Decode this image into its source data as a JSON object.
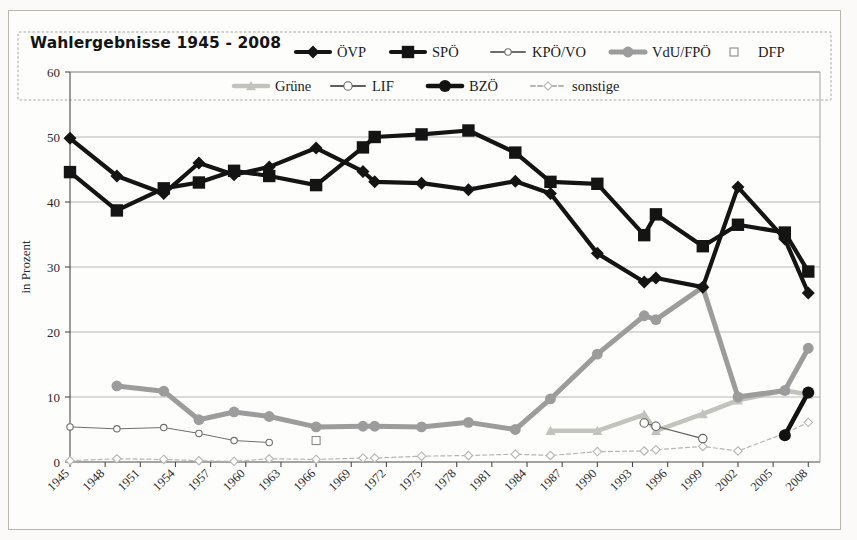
{
  "figure": {
    "title": "Wahlergebnisse 1945 - 2008",
    "background_color": "#fdfdfb",
    "border_color": "#b9b6ae"
  },
  "chart_data": {
    "type": "line",
    "title": "Wahlergebnisse 1945 - 2008",
    "xlabel": "",
    "ylabel": "in Prozent",
    "ylim": [
      0,
      60
    ],
    "ytick_step": 10,
    "yticks": [
      0,
      10,
      20,
      30,
      40,
      50,
      60
    ],
    "xlim": [
      1945,
      2009
    ],
    "xticks": [
      1945,
      1948,
      1951,
      1954,
      1957,
      1960,
      1963,
      1966,
      1969,
      1972,
      1975,
      1978,
      1981,
      1984,
      1987,
      1990,
      1993,
      1996,
      1999,
      2002,
      2005,
      2008
    ],
    "xtick_labels": [
      "1945",
      "1948",
      "1951",
      "1954",
      "1957",
      "1960",
      "1963",
      "1966",
      "1969",
      "1972",
      "1975",
      "1978",
      "1981",
      "1984",
      "1987",
      "1990",
      "1993",
      "1996",
      "1999",
      "2002",
      "2005",
      "2008"
    ],
    "grid": true,
    "grid_axis": "y",
    "legend_position": "top",
    "series": [
      {
        "name": "ÖVP",
        "marker": "diamond",
        "color": "#141414",
        "line_width": 4.2,
        "marker_size": 6.5,
        "dash": "none",
        "points": [
          {
            "x": 1945,
            "y": 49.8
          },
          {
            "x": 1949,
            "y": 44.0
          },
          {
            "x": 1953,
            "y": 41.3
          },
          {
            "x": 1956,
            "y": 46.0
          },
          {
            "x": 1959,
            "y": 44.2
          },
          {
            "x": 1962,
            "y": 45.4
          },
          {
            "x": 1966,
            "y": 48.3
          },
          {
            "x": 1970,
            "y": 44.7
          },
          {
            "x": 1971,
            "y": 43.1
          },
          {
            "x": 1975,
            "y": 42.9
          },
          {
            "x": 1979,
            "y": 41.9
          },
          {
            "x": 1983,
            "y": 43.2
          },
          {
            "x": 1986,
            "y": 41.3
          },
          {
            "x": 1990,
            "y": 32.1
          },
          {
            "x": 1994,
            "y": 27.7
          },
          {
            "x": 1995,
            "y": 28.3
          },
          {
            "x": 1999,
            "y": 26.9
          },
          {
            "x": 2002,
            "y": 42.3
          },
          {
            "x": 2006,
            "y": 34.3
          },
          {
            "x": 2008,
            "y": 26.0
          }
        ]
      },
      {
        "name": "SPÖ",
        "marker": "square",
        "color": "#141414",
        "line_width": 4.2,
        "marker_size": 6.2,
        "dash": "none",
        "points": [
          {
            "x": 1945,
            "y": 44.6
          },
          {
            "x": 1949,
            "y": 38.7
          },
          {
            "x": 1953,
            "y": 42.1
          },
          {
            "x": 1956,
            "y": 43.0
          },
          {
            "x": 1959,
            "y": 44.8
          },
          {
            "x": 1962,
            "y": 44.0
          },
          {
            "x": 1966,
            "y": 42.6
          },
          {
            "x": 1970,
            "y": 48.4
          },
          {
            "x": 1971,
            "y": 50.0
          },
          {
            "x": 1975,
            "y": 50.4
          },
          {
            "x": 1979,
            "y": 51.0
          },
          {
            "x": 1983,
            "y": 47.6
          },
          {
            "x": 1986,
            "y": 43.1
          },
          {
            "x": 1990,
            "y": 42.8
          },
          {
            "x": 1994,
            "y": 34.9
          },
          {
            "x": 1995,
            "y": 38.1
          },
          {
            "x": 1999,
            "y": 33.2
          },
          {
            "x": 2002,
            "y": 36.5
          },
          {
            "x": 2006,
            "y": 35.3
          },
          {
            "x": 2008,
            "y": 29.3
          }
        ]
      },
      {
        "name": "KPÖ/VO",
        "marker": "circle-open",
        "color": "#6e6e6e",
        "line_width": 1.0,
        "marker_size": 3.2,
        "dash": "none",
        "points": [
          {
            "x": 1945,
            "y": 5.4
          },
          {
            "x": 1949,
            "y": 5.1
          },
          {
            "x": 1953,
            "y": 5.3
          },
          {
            "x": 1956,
            "y": 4.4
          },
          {
            "x": 1959,
            "y": 3.3
          },
          {
            "x": 1962,
            "y": 3.0
          }
        ]
      },
      {
        "name": "VdU/FPÖ",
        "marker": "circle",
        "color": "#9c9c9c",
        "line_width": 5.0,
        "marker_size": 5.4,
        "dash": "none",
        "points": [
          {
            "x": 1949,
            "y": 11.7
          },
          {
            "x": 1953,
            "y": 10.9
          },
          {
            "x": 1956,
            "y": 6.5
          },
          {
            "x": 1959,
            "y": 7.7
          },
          {
            "x": 1962,
            "y": 7.0
          },
          {
            "x": 1966,
            "y": 5.4
          },
          {
            "x": 1970,
            "y": 5.5
          },
          {
            "x": 1971,
            "y": 5.5
          },
          {
            "x": 1975,
            "y": 5.4
          },
          {
            "x": 1979,
            "y": 6.1
          },
          {
            "x": 1983,
            "y": 5.0
          },
          {
            "x": 1986,
            "y": 9.7
          },
          {
            "x": 1990,
            "y": 16.6
          },
          {
            "x": 1994,
            "y": 22.5
          },
          {
            "x": 1995,
            "y": 21.9
          },
          {
            "x": 1999,
            "y": 26.9
          },
          {
            "x": 2002,
            "y": 10.0
          },
          {
            "x": 2006,
            "y": 11.0
          },
          {
            "x": 2008,
            "y": 17.5
          }
        ]
      },
      {
        "name": "DFP",
        "marker": "square-open",
        "color": "#8a8a8a",
        "line_width": 0,
        "marker_size": 4.0,
        "dash": "none",
        "points": [
          {
            "x": 1966,
            "y": 3.3
          }
        ]
      },
      {
        "name": "Grüne",
        "marker": "triangle",
        "color": "#c3c3bd",
        "line_width": 4.6,
        "marker_size": 5.0,
        "dash": "none",
        "points": [
          {
            "x": 1986,
            "y": 4.8
          },
          {
            "x": 1990,
            "y": 4.8
          },
          {
            "x": 1994,
            "y": 7.3
          },
          {
            "x": 1995,
            "y": 4.8
          },
          {
            "x": 1999,
            "y": 7.4
          },
          {
            "x": 2002,
            "y": 9.5
          },
          {
            "x": 2006,
            "y": 11.0
          },
          {
            "x": 2008,
            "y": 10.4
          }
        ]
      },
      {
        "name": "LIF",
        "marker": "circle-open",
        "color": "#5e5e5e",
        "line_width": 1.2,
        "marker_size": 4.2,
        "dash": "none",
        "points": [
          {
            "x": 1994,
            "y": 6.0
          },
          {
            "x": 1995,
            "y": 5.5
          },
          {
            "x": 1999,
            "y": 3.6
          }
        ]
      },
      {
        "name": "BZÖ",
        "marker": "circle-filled",
        "color": "#121212",
        "line_width": 4.6,
        "marker_size": 6.0,
        "dash": "none",
        "points": [
          {
            "x": 2006,
            "y": 4.1
          },
          {
            "x": 2008,
            "y": 10.7
          }
        ]
      },
      {
        "name": "sonstige",
        "marker": "diamond-open",
        "color": "#b6b6b0",
        "line_width": 1.2,
        "marker_size": 4.2,
        "dash": "4 3",
        "points": [
          {
            "x": 1945,
            "y": 0.2
          },
          {
            "x": 1949,
            "y": 0.5
          },
          {
            "x": 1953,
            "y": 0.4
          },
          {
            "x": 1956,
            "y": 0.2
          },
          {
            "x": 1959,
            "y": 0.1
          },
          {
            "x": 1962,
            "y": 0.5
          },
          {
            "x": 1966,
            "y": 0.4
          },
          {
            "x": 1970,
            "y": 0.6
          },
          {
            "x": 1971,
            "y": 0.6
          },
          {
            "x": 1975,
            "y": 0.9
          },
          {
            "x": 1979,
            "y": 1.0
          },
          {
            "x": 1983,
            "y": 1.2
          },
          {
            "x": 1986,
            "y": 1.0
          },
          {
            "x": 1990,
            "y": 1.6
          },
          {
            "x": 1994,
            "y": 1.7
          },
          {
            "x": 1995,
            "y": 1.9
          },
          {
            "x": 1999,
            "y": 2.4
          },
          {
            "x": 2002,
            "y": 1.7
          },
          {
            "x": 2006,
            "y": 4.4
          },
          {
            "x": 2008,
            "y": 6.1
          }
        ]
      }
    ]
  },
  "legend": {
    "rows": [
      [
        {
          "label": "ÖVP",
          "series": "ÖVP"
        },
        {
          "label": "SPÖ",
          "series": "SPÖ"
        },
        {
          "label": "KPÖ/VO",
          "series": "KPÖ/VO"
        },
        {
          "label": "VdU/FPÖ",
          "series": "VdU/FPÖ"
        },
        {
          "label": "DFP",
          "series": "DFP"
        }
      ],
      [
        {
          "label": "Grüne",
          "series": "Grüne"
        },
        {
          "label": "LIF",
          "series": "LIF"
        },
        {
          "label": "BZÖ",
          "series": "BZÖ"
        },
        {
          "label": "sonstige",
          "series": "sonstige"
        }
      ]
    ]
  },
  "axes": {
    "y_axis_title": "in Prozent",
    "y_tick_labels": [
      "60",
      "50",
      "40",
      "30",
      "20",
      "10",
      "0"
    ]
  }
}
